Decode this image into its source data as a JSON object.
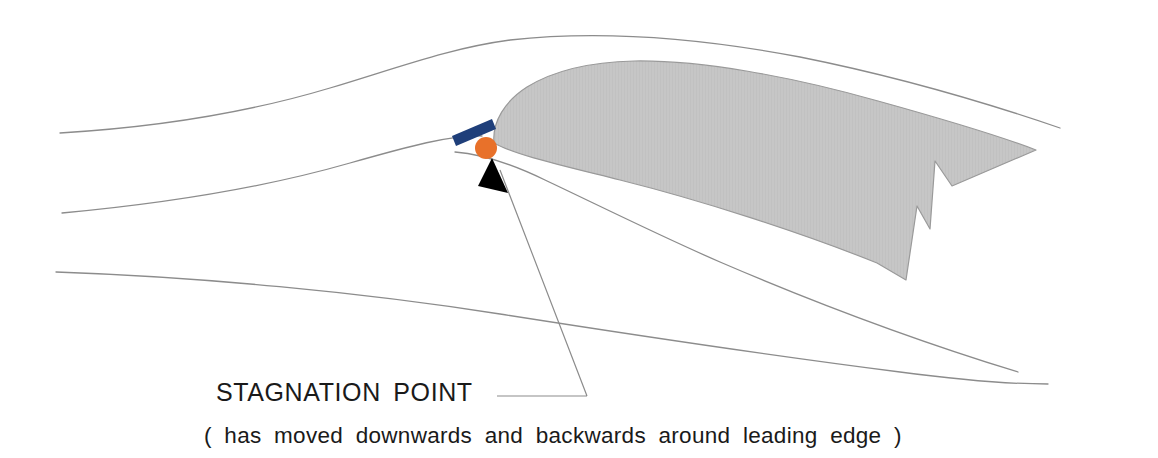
{
  "diagram": {
    "annotations": {
      "stagnation_label": "STAGNATION POINT",
      "subtitle": "( has moved downwards and backwards around leading edge )"
    },
    "colors": {
      "background": "#ffffff",
      "airfoil_fill": "#c6c6c6",
      "airfoil_stroke": "#9a9a9a",
      "streamline": "#8c8c8c",
      "stagnation_marker": "#e8712a",
      "chord_bar": "#1f3f7a",
      "arrow": "#000000",
      "leader_line": "#8c8c8c",
      "text": "#1a1a1a"
    },
    "elements": {
      "airfoil_name": "airfoil-body",
      "marker_name": "stagnation-point-marker",
      "bar_name": "chord-reference-bar",
      "arrow_name": "annotation-arrowhead"
    },
    "geometry": {
      "airfoil_path": "M 494 143 C 492 122, 505 101, 527 87 C 553 71, 590 62, 634 61 C 700 60, 790 76, 878 101 C 950 121, 1005 138, 1036 150 L 952 186 L 935 161 L 930 229 L 917 206 L 906 280 L 877 263 C 800 232, 700 200, 620 180 C 560 165, 515 155, 494 143 Z",
      "chord_bar_points": "452 136 492 119 496 129 456 146",
      "arrowhead_points": "492 158 508 193 478 186",
      "marker_cx": 486,
      "marker_cy": 148,
      "marker_r": 11,
      "leader_path": "M 587 396 L 497 396 M 587 396 L 500 170",
      "streamlines": [
        {
          "name": "upper-streamline",
          "d": "M 60 133 C 160 127, 250 112, 330 88 C 400 67, 450 48, 510 40 C 600 30, 700 38, 800 57 C 900 77, 990 104, 1060 128"
        },
        {
          "name": "dividing-streamline",
          "d": "M 62 213 C 170 203, 270 186, 350 163 C 410 146, 450 135, 482 136"
        },
        {
          "name": "lower-streamline-near",
          "d": "M 455 152 C 480 154, 510 163, 545 180 C 600 206, 660 236, 720 262 C 820 305, 930 345, 1018 372"
        },
        {
          "name": "lower-streamline-far",
          "d": "M 56 272 C 200 277, 360 292, 500 314 C 640 336, 790 358, 900 372 C 960 380, 1010 384, 1048 384"
        }
      ]
    }
  }
}
